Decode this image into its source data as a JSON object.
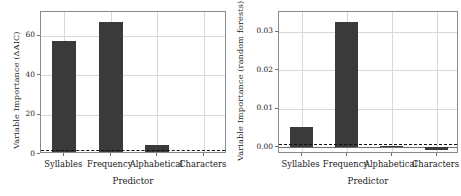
{
  "chart_data": [
    {
      "panel": "left",
      "type": "bar",
      "title": "",
      "xlabel": "Predictor",
      "ylabel": "Variable Importance (ΔAIC)",
      "categories": [
        "Syllables",
        "Frequency",
        "Alphabetical",
        "Characters"
      ],
      "values": [
        57.3,
        67.0,
        4.5,
        0.2
      ],
      "ylim": [
        0,
        72
      ],
      "yticks": [
        0,
        20,
        40,
        60
      ],
      "ytick_labels": [
        "0",
        "20",
        "40",
        "60"
      ],
      "grid": true,
      "legend": "none",
      "threshold_line": {
        "value": 2.0,
        "style": "dashed",
        "color": "#111111"
      },
      "bar_color": "#3a3a3a"
    },
    {
      "panel": "right",
      "type": "bar",
      "title": "",
      "xlabel": "Predictor",
      "ylabel": "Variable Importance (random forests)",
      "categories": [
        "Syllables",
        "Frequency",
        "Alphabetical",
        "Characters"
      ],
      "values": [
        0.0053,
        0.0325,
        0.0002,
        -0.0008
      ],
      "ylim": [
        -0.0018,
        0.0352
      ],
      "yticks": [
        0.0,
        0.01,
        0.02,
        0.03
      ],
      "ytick_labels": [
        "0.00",
        "0.01",
        "0.02",
        "0.03"
      ],
      "grid": true,
      "legend": "none",
      "threshold_line": {
        "value": 0.0008,
        "style": "dashed",
        "color": "#111111"
      },
      "bar_color": "#3a3a3a"
    }
  ]
}
